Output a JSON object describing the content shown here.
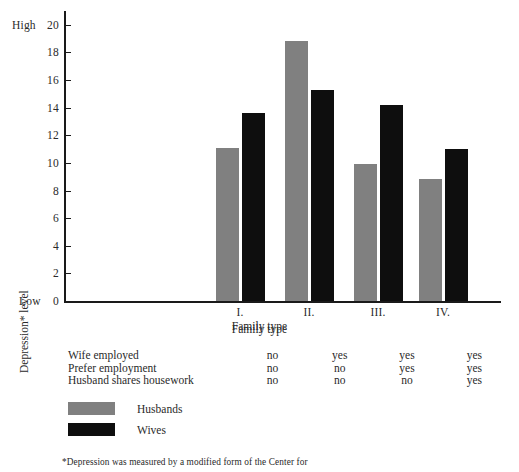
{
  "chart_data": {
    "type": "bar",
    "title": "",
    "xlabel": "Family type",
    "ylabel": "Depression* level",
    "ylim": [
      0,
      21
    ],
    "yticks": [
      0,
      2,
      4,
      6,
      8,
      10,
      12,
      14,
      16,
      18,
      20
    ],
    "ytick_labels": [
      "0",
      "2",
      "4",
      "6",
      "8",
      "10",
      "12",
      "14",
      "16",
      "18",
      "20"
    ],
    "axis_end_labels": {
      "high": "High",
      "low": "Low"
    },
    "grid": false,
    "categories": [
      "I.",
      "II.",
      "III.",
      "IV."
    ],
    "series": [
      {
        "name": "Husbands",
        "color": "#808080",
        "values": [
          11.1,
          18.8,
          9.9,
          8.8
        ]
      },
      {
        "name": "Wives",
        "color": "#0e0e0e",
        "values": [
          13.6,
          15.3,
          14.2,
          11.0
        ]
      }
    ],
    "legend": {
      "position": "below-left",
      "entries": [
        "Husbands",
        "Wives"
      ]
    },
    "condition_table": {
      "header": "Family type",
      "rows": [
        {
          "label": "Wife employed",
          "values": [
            "no",
            "yes",
            "yes",
            "yes"
          ]
        },
        {
          "label": "Prefer employment",
          "values": [
            "no",
            "no",
            "yes",
            "yes"
          ]
        },
        {
          "label": "Husband shares housework",
          "values": [
            "no",
            "no",
            "no",
            "yes"
          ]
        }
      ]
    },
    "footnote": "*Depression was measured by a modified form of the Center for"
  },
  "colors": {
    "husbands": "#808080",
    "wives": "#0e0e0e",
    "axis": "#1a1a1a",
    "text": "#2a2a2a",
    "background": "#ffffff"
  }
}
